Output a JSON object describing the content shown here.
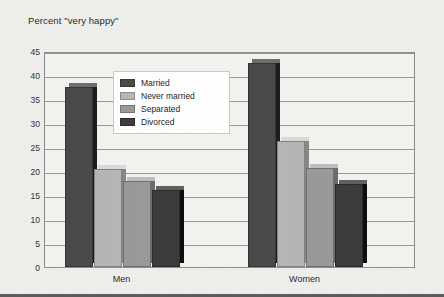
{
  "chart_data": {
    "type": "bar",
    "title": "Percent \"very happy\"",
    "xlabel": "",
    "ylabel": "",
    "ylim": [
      0,
      45
    ],
    "ytick_step": 5,
    "yticks": [
      "45",
      "40",
      "35",
      "30",
      "25",
      "20",
      "15",
      "10",
      "5",
      "0"
    ],
    "grid": true,
    "legend_position": "inside-top-center",
    "categories": [
      "Men",
      "Women"
    ],
    "series": [
      {
        "name": "Married",
        "values": [
          37.5,
          42.4
        ],
        "color": "#4a4a4a"
      },
      {
        "name": "Never married",
        "values": [
          20.5,
          26.2
        ],
        "color": "#b6b6b6"
      },
      {
        "name": "Separated",
        "values": [
          18.0,
          20.6
        ],
        "color": "#9a9a9a"
      },
      {
        "name": "Divorced",
        "values": [
          16.0,
          17.3
        ],
        "color": "#3c3c3c"
      }
    ]
  },
  "plot": {
    "background": "#f3f3f0",
    "border_color": "#8d8d8d",
    "gridline_color": "#9a9a9a"
  },
  "page": {
    "background": "#efefec",
    "bottom_rule_color": "#5d5d5d"
  }
}
